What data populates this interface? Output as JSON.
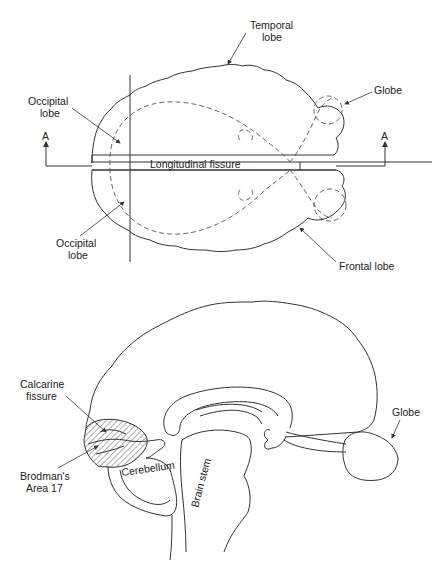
{
  "top_view": {
    "labels": {
      "temporal_lobe": [
        "Temporal",
        "lobe"
      ],
      "globe": "Globe",
      "occipital_lobe_upper": [
        "Occipital",
        "lobe"
      ],
      "occipital_lobe_lower": [
        "Occipital",
        "lobe"
      ],
      "longitudinal_fissure": "Longitudinal fissure",
      "frontal_lobe": "Frontal lobe",
      "section_left": "A",
      "section_right": "A"
    }
  },
  "sagittal_view": {
    "labels": {
      "calcarine_fissure": [
        "Calcarine",
        "fissure"
      ],
      "brodmans_area": [
        "Brodman's",
        "Area 17"
      ],
      "cerebellum": "Cerebellum",
      "brain_stem": "Brain stem",
      "globe": "Globe"
    }
  }
}
